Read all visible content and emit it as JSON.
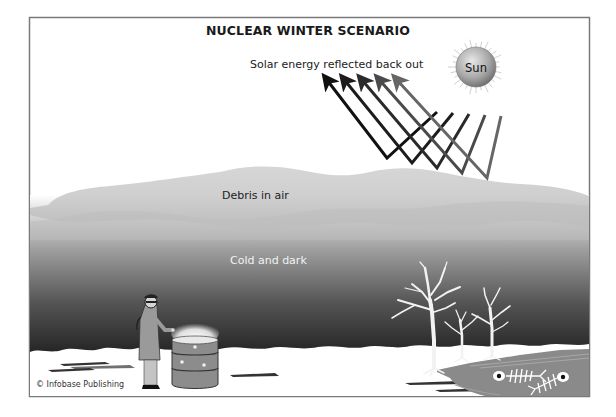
{
  "diagram": {
    "title": "NUCLEAR WINTER SCENARIO",
    "labels": {
      "solar_reflection": "Solar energy reflected back out",
      "sun": "Sun",
      "debris": "Debris in air",
      "cold_dark": "Cold and dark"
    },
    "credit": "© Infobase Publishing",
    "reflected_arrow_count": 5,
    "arrow_colors": [
      "#111111",
      "#1c1c1c",
      "#2a2a2a",
      "#4a4a4a",
      "#666666"
    ],
    "colors": {
      "sky": "#ffffff",
      "debris": "#c8c8c8",
      "dark_air": "#2a2a2a",
      "snow": "#ffffff",
      "frame": "#7a7a7a",
      "water": "#8a8a8a",
      "sun": "#a8a8a8"
    },
    "scene_elements": [
      "sun",
      "reflected-sunlight-arrows",
      "debris-cloud",
      "dark-cold-air",
      "snow-ground",
      "person-warming-hands",
      "burning-barrel",
      "dead-trees",
      "frozen-pond",
      "fish-skeletons"
    ]
  }
}
